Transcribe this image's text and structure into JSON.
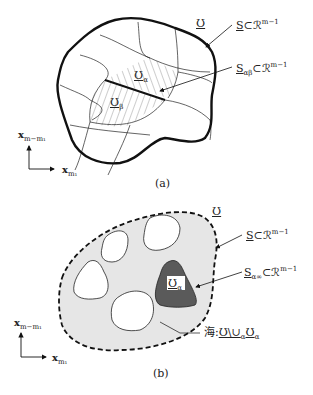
{
  "panel_a": {
    "caption": "(a)",
    "domain_label": "Ʊ",
    "boundary_label": {
      "main": "S",
      "subset": "⊂",
      "space": "ℛ",
      "exp": "m−1"
    },
    "interface_label": {
      "main": "S",
      "sub": "αβ",
      "subset": "⊂",
      "space": "ℛ",
      "exp": "m−1"
    },
    "region_alpha": {
      "main": "Ʊ",
      "sub": "α"
    },
    "region_beta": {
      "main": "Ʊ",
      "sub": "β"
    },
    "axis_y": {
      "main": "x",
      "sub": "m−m₁"
    },
    "axis_x": {
      "main": "x",
      "sub": "m₁"
    }
  },
  "panel_b": {
    "caption": "(b)",
    "domain_label": "Ʊ",
    "boundary_label": {
      "main": "S",
      "subset": "⊂",
      "space": "ℛ",
      "exp": "m−1"
    },
    "island_label": {
      "main": "S",
      "sub": "α∞",
      "subset": "⊂",
      "space": "ℛ",
      "exp": "m−1"
    },
    "island_region": {
      "main": "Ʊ",
      "sub": "α"
    },
    "sea_label": {
      "prefix": "海:",
      "expr": "Ʊ\\∪",
      "sub1": "α",
      "expr2": "Ʊ",
      "sub2": "α"
    },
    "axis_y": {
      "main": "x",
      "sub": "m−m₁"
    },
    "axis_x": {
      "main": "x",
      "sub": "m₁"
    }
  },
  "colors": {
    "stroke": "#111111",
    "sea_fill": "#e6e6e6",
    "island_fill": "#5a5a5a",
    "hatch": "#555555"
  }
}
